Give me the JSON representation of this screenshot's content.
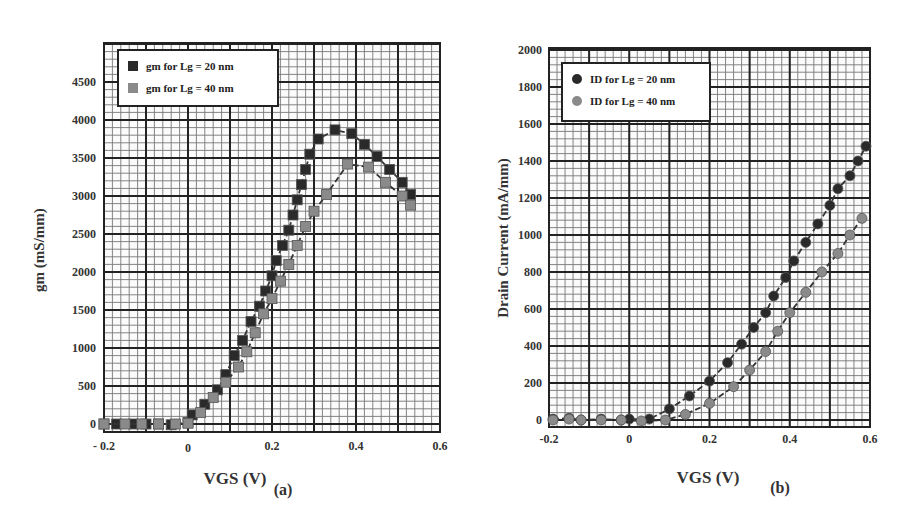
{
  "chart_data": [
    {
      "panel": "(a)",
      "type": "scatter",
      "title": "",
      "xlabel": "VGS (V)",
      "ylabel": "gm (mS/mm)",
      "xlim": [
        -0.2,
        0.6
      ],
      "ylim": [
        0,
        5000
      ],
      "xticks": [
        "- 0.2",
        "0",
        "0.2",
        "0.4",
        "0.6"
      ],
      "xtick_values": [
        -0.2,
        0,
        0.2,
        0.4,
        0.6
      ],
      "yticks": [
        "0",
        "500",
        "1000",
        "1500",
        "2000",
        "2500",
        "3000",
        "3500",
        "4000",
        "4500"
      ],
      "ytick_values": [
        0,
        500,
        1000,
        1500,
        2000,
        2500,
        3000,
        3500,
        4000,
        4500
      ],
      "grid": true,
      "legend_position": "upper left",
      "series": [
        {
          "name": "gm for Lg = 20 nm",
          "marker": "square",
          "color": "#2a2a2a",
          "x": [
            -0.2,
            -0.17,
            -0.13,
            -0.1,
            -0.07,
            -0.04,
            0.0,
            0.01,
            0.04,
            0.07,
            0.09,
            0.11,
            0.13,
            0.15,
            0.17,
            0.185,
            0.2,
            0.21,
            0.225,
            0.24,
            0.25,
            0.26,
            0.27,
            0.28,
            0.29,
            0.31,
            0.35,
            0.39,
            0.42,
            0.45,
            0.48,
            0.51,
            0.53
          ],
          "y": [
            0,
            0,
            0,
            0,
            0,
            -10,
            20,
            120,
            260,
            450,
            650,
            900,
            1100,
            1350,
            1550,
            1750,
            1950,
            2150,
            2350,
            2550,
            2750,
            2950,
            3150,
            3350,
            3550,
            3750,
            3870,
            3820,
            3680,
            3520,
            3350,
            3180,
            3020
          ]
        },
        {
          "name": "gm for Lg = 40 nm",
          "marker": "square",
          "color": "#8a8a8a",
          "x": [
            -0.2,
            -0.15,
            -0.11,
            -0.07,
            -0.03,
            0.0,
            0.03,
            0.06,
            0.09,
            0.12,
            0.14,
            0.16,
            0.18,
            0.2,
            0.22,
            0.24,
            0.26,
            0.28,
            0.3,
            0.33,
            0.38,
            0.43,
            0.47,
            0.51,
            0.53
          ],
          "y": [
            0,
            0,
            0,
            0,
            0,
            10,
            150,
            350,
            550,
            750,
            950,
            1200,
            1450,
            1650,
            1880,
            2100,
            2350,
            2600,
            2800,
            3020,
            3420,
            3380,
            3180,
            3000,
            2880
          ]
        }
      ]
    },
    {
      "panel": "(b)",
      "type": "scatter",
      "title": "",
      "xlabel": "VGS (V)",
      "ylabel": "Drain Current (mA/mm)",
      "xlim": [
        -0.2,
        0.6
      ],
      "ylim": [
        0,
        2000
      ],
      "xticks": [
        "-0.2",
        "0",
        "0.2",
        "0.4",
        "0.6"
      ],
      "xtick_values": [
        -0.2,
        0,
        0.2,
        0.4,
        0.6
      ],
      "yticks": [
        "0",
        "200",
        "400",
        "600",
        "800",
        "1000",
        "1200",
        "1400",
        "1600",
        "1800",
        "2000"
      ],
      "ytick_values": [
        0,
        200,
        400,
        600,
        800,
        1000,
        1200,
        1400,
        1600,
        1800,
        2000
      ],
      "grid": true,
      "legend_position": "upper left",
      "series": [
        {
          "name": "ID for Lg = 20 nm",
          "marker": "circle",
          "color": "#2a2a2a",
          "x": [
            -0.19,
            -0.15,
            -0.12,
            -0.07,
            -0.02,
            0.0,
            0.05,
            0.1,
            0.15,
            0.2,
            0.245,
            0.28,
            0.31,
            0.34,
            0.36,
            0.39,
            0.41,
            0.44,
            0.47,
            0.5,
            0.52,
            0.55,
            0.57,
            0.59
          ],
          "y": [
            5,
            10,
            0,
            5,
            0,
            5,
            5,
            60,
            130,
            210,
            310,
            410,
            500,
            580,
            670,
            770,
            860,
            960,
            1060,
            1160,
            1250,
            1320,
            1400,
            1480
          ]
        },
        {
          "name": "ID for Lg = 40 nm",
          "marker": "circle",
          "color": "#8a8a8a",
          "x": [
            -0.19,
            -0.15,
            -0.12,
            -0.07,
            -0.02,
            0.03,
            0.09,
            0.14,
            0.2,
            0.26,
            0.3,
            0.34,
            0.37,
            0.4,
            0.44,
            0.48,
            0.52,
            0.55,
            0.58
          ],
          "y": [
            0,
            5,
            0,
            0,
            0,
            -5,
            0,
            30,
            90,
            180,
            270,
            370,
            480,
            580,
            690,
            800,
            900,
            1000,
            1090
          ]
        }
      ]
    }
  ]
}
